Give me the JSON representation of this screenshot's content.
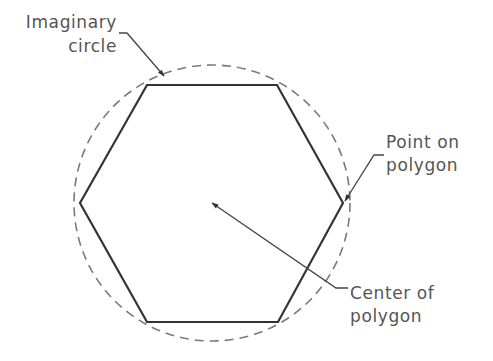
{
  "diagram": {
    "type": "technical-drawing",
    "colors": {
      "polygon_stroke": "#333333",
      "circle_stroke": "#777777",
      "leader_stroke": "#444444",
      "text": "#555555",
      "background": "#ffffff"
    },
    "shapes": {
      "hexagon": {
        "vertices": [
          [
            147,
            85
          ],
          [
            277,
            85
          ],
          [
            343,
            203
          ],
          [
            278,
            322
          ],
          [
            147,
            322
          ],
          [
            80,
            203
          ]
        ]
      },
      "circle": {
        "cx": 212,
        "cy": 203,
        "r": 138,
        "style": "dashed"
      },
      "center_point": [
        211,
        203
      ]
    },
    "labels": {
      "imaginary_circle": {
        "line1": "Imaginary",
        "line2": "circle"
      },
      "point_on_polygon": {
        "line1": "Point on",
        "line2": "polygon"
      },
      "center_of_polygon": {
        "line1": "Center of",
        "line2": "polygon"
      }
    }
  }
}
